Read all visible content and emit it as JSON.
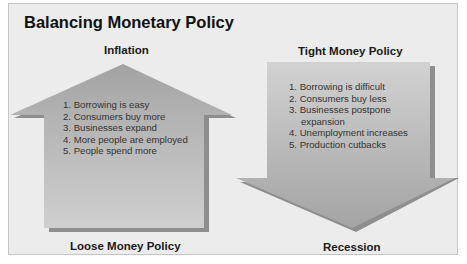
{
  "title": "Balancing Monetary Policy",
  "up_arrow": {
    "top_label": "Inflation",
    "bottom_label": "Loose Money Policy",
    "items": [
      "1. Borrowing is easy",
      "2. Consumers buy more",
      "3. Businesses expand",
      "4. More people are employed",
      "5. People spend more"
    ]
  },
  "down_arrow": {
    "top_label": "Tight Money Policy",
    "bottom_label": "Recession",
    "items": [
      "1. Borrowing is difficult",
      "2. Consumers buy less",
      "3. Businesses postpone",
      "expansion",
      "4. Unemployment increases",
      "5. Production cutbacks"
    ]
  },
  "colors": {
    "panel_bg": "#ececec",
    "arrow_fill_light": "#c6c6c6",
    "arrow_fill_dark": "#9c9c9c",
    "shadow": "#8a8a8a",
    "text": "#333333"
  }
}
